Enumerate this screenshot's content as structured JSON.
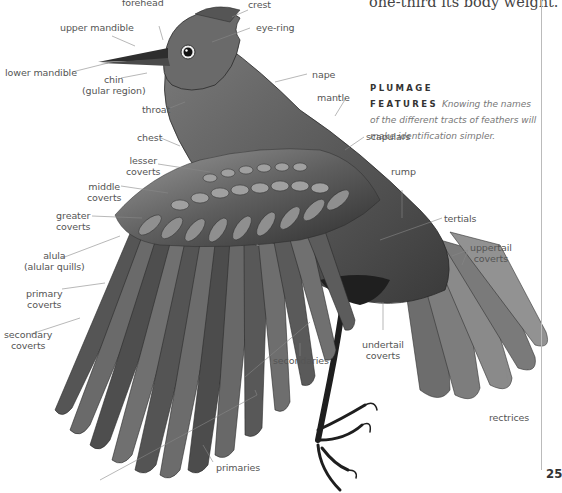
{
  "page": {
    "body_text_fragment": "one-third its body weight.",
    "caption": {
      "heading": "PLUMAGE FEATURES",
      "text": "Knowing the names of the different tracts of feathers will make identification simpler."
    },
    "page_number": "25"
  },
  "illustration": {
    "subject": "bird-with-spread-wing",
    "labels": {
      "forehead": "forehead",
      "crest": "crest",
      "upper_mandible": "upper mandible",
      "eye_ring": "eye-ring",
      "lower_mandible": "lower mandible",
      "chin_1": "chin",
      "chin_2": "(gular region)",
      "nape": "nape",
      "throat": "throat",
      "mantle": "mantle",
      "chest": "chest",
      "scapulars": "scapulars",
      "lesser_coverts_1": "lesser",
      "lesser_coverts_2": "coverts",
      "rump": "rump",
      "middle_coverts_1": "middle",
      "middle_coverts_2": "coverts",
      "tertials": "tertials",
      "greater_coverts_1": "greater",
      "greater_coverts_2": "coverts",
      "uppertail_coverts_1": "uppertail",
      "uppertail_coverts_2": "coverts",
      "alula_1": "alula",
      "alula_2": "(alular quills)",
      "primary_coverts_1": "primary",
      "primary_coverts_2": "coverts",
      "secondary_coverts_1": "secondary",
      "secondary_coverts_2": "coverts",
      "secondaries": "secondaries",
      "undertail_coverts_1": "undertail",
      "undertail_coverts_2": "coverts",
      "rectrices": "rectrices",
      "primaries": "primaries"
    }
  }
}
